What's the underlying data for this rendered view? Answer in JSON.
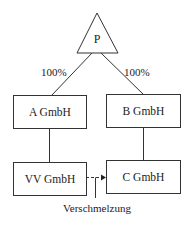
{
  "diagram": {
    "parent": {
      "label": "P"
    },
    "edges": [
      {
        "from": "P",
        "to": "A GmbH",
        "label": "100%"
      },
      {
        "from": "P",
        "to": "B GmbH",
        "label": "100%"
      },
      {
        "from": "A GmbH",
        "to": "VV GmbH",
        "label": ""
      },
      {
        "from": "B GmbH",
        "to": "C GmbH",
        "label": ""
      },
      {
        "from": "VV GmbH",
        "to": "C GmbH",
        "label": "Verschmelzung",
        "style": "dashed-arrow"
      }
    ],
    "nodes": {
      "a": {
        "label": "A GmbH"
      },
      "b": {
        "label": "B GmbH"
      },
      "vv": {
        "label": "VV GmbH"
      },
      "c": {
        "label": "C GmbH"
      }
    },
    "edge_labels": {
      "left_pct": "100%",
      "right_pct": "100%",
      "merger": "Verschmelzung"
    },
    "colors": {
      "line": "#333333",
      "background": "#ffffff",
      "text": "#222222"
    }
  }
}
